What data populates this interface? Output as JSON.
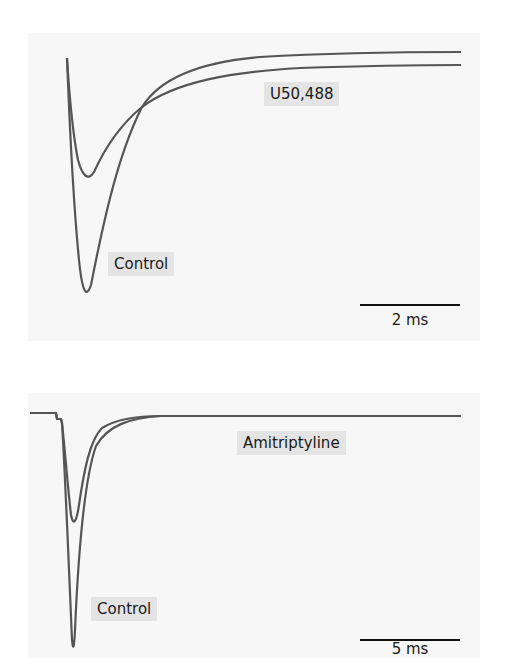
{
  "chart_data": [
    {
      "type": "line",
      "title": "",
      "xlabel": "",
      "ylabel": "",
      "grid": false,
      "legend": "inline labels",
      "scale_bar": {
        "label": "2 ms",
        "value_ms": 2
      },
      "series": [
        {
          "name": "U50,488",
          "description": "smaller inward current, peak ~40% of control, slower decay to higher steady baseline",
          "relative_peak": -0.5
        },
        {
          "name": "Control",
          "description": "large transient inward current, faster activation, deeper peak",
          "relative_peak": -1.0
        }
      ],
      "annotations": [
        "U50,488",
        "Control",
        "2 ms"
      ]
    },
    {
      "type": "line",
      "title": "",
      "xlabel": "",
      "ylabel": "",
      "grid": false,
      "legend": "inline labels",
      "scale_bar": {
        "label": "5 ms",
        "value_ms": 5
      },
      "series": [
        {
          "name": "Amitriptyline",
          "description": "reduced inward current, peak ~47% of control",
          "relative_peak": -0.47
        },
        {
          "name": "Control",
          "description": "large transient inward current returning to baseline within ~5 ms",
          "relative_peak": -1.0
        }
      ],
      "annotations": [
        "Amitriptyline",
        "Control",
        "5 ms"
      ]
    }
  ],
  "top_panel": {
    "label_drug": "U50,488",
    "label_control": "Control",
    "scale_label": "2 ms",
    "paths": {
      "drug": "M67,58 C69,90 72,130 78,160 C82,175 88,182 94,172 C104,150 120,125 142,107 C175,82 230,72 300,68 C360,66 420,65 461,65",
      "control": "M67,58 C69,110 73,200 79,260 C82,290 86,300 91,285 C100,240 115,160 142,107 C160,78 200,62 260,57 C330,53 400,52 461,52"
    }
  },
  "bottom_panel": {
    "label_drug": "Amitriptyline",
    "label_control": "Control",
    "scale_label": "5 ms",
    "paths": {
      "drug": "M30,413 L56,413 L57,419 L61,419 L62,423 C65,450 68,490 71,515 C73,525 76,525 79,505 C84,470 90,440 102,428 C118,418 140,416 161,416 L461,416",
      "control": "M30,413 L56,413 L57,419 L61,419 L62,423 C65,470 69,570 72,640 C73,650 74,650 75,630 C78,560 84,480 96,446 C108,425 130,418 161,416 L461,416"
    }
  },
  "colors": {
    "trace": "#555555",
    "panel_bg": "#f7f7f7",
    "label_bg": "#e4e4e4",
    "text": "#1a1a1a"
  }
}
